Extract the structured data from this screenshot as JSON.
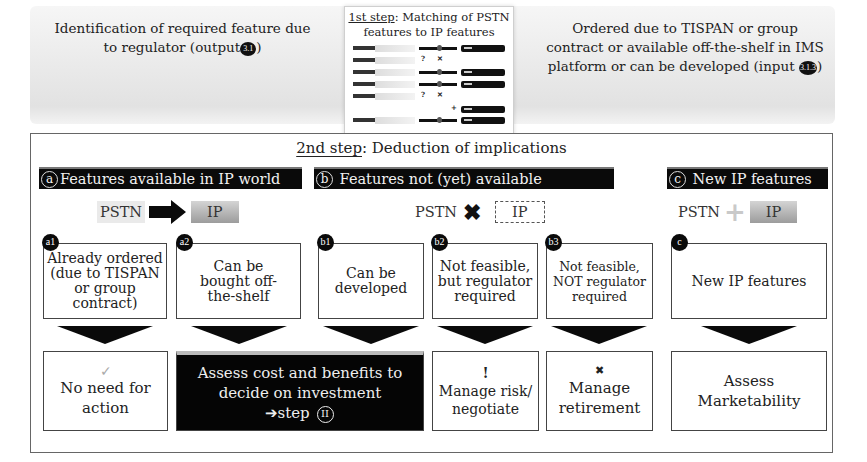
{
  "top": {
    "left_text_line1": "Identification of required feature due",
    "left_text_line2": "to regulator (output",
    "left_badge": "3.1",
    "right_text_line1": "Ordered due to TISPAN or group",
    "right_text_line2": "contract or available off-the-shelf in IMS",
    "right_text_line3": "platform or can be developed (input",
    "right_badge": "3.1.3",
    "close_paren": ")"
  },
  "step1": {
    "title_underlined": "1st step",
    "title_rest": ": Matching of PSTN",
    "title_line2": "features to IP features",
    "rows": [
      {
        "type": "match",
        "mark": ""
      },
      {
        "type": "nomatch",
        "mark": "? ✕"
      },
      {
        "type": "match",
        "mark": ""
      },
      {
        "type": "match",
        "mark": ""
      },
      {
        "type": "nomatch",
        "mark": "? ✕"
      },
      {
        "type": "new",
        "mark": "⊕"
      },
      {
        "type": "match",
        "mark": ""
      }
    ]
  },
  "step2": {
    "title_underlined": "2nd step",
    "title_rest": ": Deduction of implications"
  },
  "categories": [
    {
      "letter": "a",
      "title": "Features available in IP world",
      "flow_left": "PSTN",
      "flow_symbol": "arrow",
      "flow_right": "IP"
    },
    {
      "letter": "b",
      "title": "Features not (yet) available",
      "flow_left": "PSTN",
      "flow_symbol": "✖",
      "flow_right": "IP"
    },
    {
      "letter": "c",
      "title": "New IP features",
      "flow_left": "PSTN",
      "flow_symbol": "+",
      "flow_right": "IP"
    }
  ],
  "cases": [
    {
      "id": "a1",
      "text": "Already ordered (due to TISPAN or group contract)"
    },
    {
      "id": "a2",
      "text": "Can be bought off-the-shelf"
    },
    {
      "id": "b1",
      "text": "Can be developed"
    },
    {
      "id": "b2",
      "text": "Not feasible, but regulator required"
    },
    {
      "id": "b3",
      "text": "Not feasible, NOT regulator required"
    },
    {
      "id": "c",
      "text": "New IP features"
    }
  ],
  "results": [
    {
      "icon": "✓",
      "text": "No need for action"
    },
    {
      "icon": "",
      "text": "Assess cost and benefits to decide on investment",
      "step_text": "➔step",
      "step_badge": "II"
    },
    {
      "icon": "!",
      "text": "Manage risk/ negotiate"
    },
    {
      "icon": "✖",
      "text": "Manage retirement"
    },
    {
      "icon": "",
      "text": "Assess Marketability"
    }
  ]
}
